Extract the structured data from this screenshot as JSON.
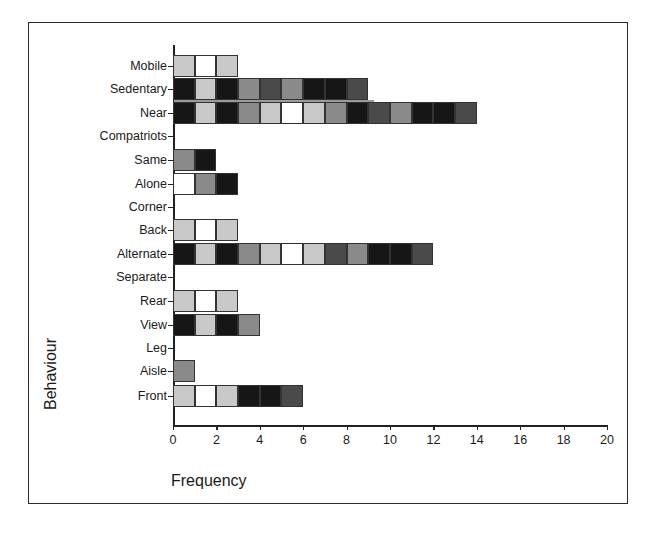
{
  "chart_data": {
    "type": "bar",
    "orientation": "horizontal",
    "stacked": true,
    "title": "",
    "xlabel": "Frequency",
    "ylabel": "Behaviour",
    "xlim": [
      0,
      20
    ],
    "xticks": [
      0,
      2,
      4,
      6,
      8,
      10,
      12,
      14,
      16,
      18,
      20
    ],
    "grid": false,
    "legend": null,
    "categories": [
      "Mobile",
      "Sedentary",
      "Near",
      "Compatriots",
      "Same",
      "Alone",
      "Corner",
      "Back",
      "Alternate",
      "Separate",
      "Rear",
      "View",
      "Leg",
      "Aisle",
      "Front"
    ],
    "values": [
      3,
      9,
      14,
      0,
      2,
      3,
      0,
      3,
      12,
      0,
      3,
      4,
      0,
      1,
      6
    ],
    "segment_shades": {
      "Mobile": [
        "light",
        "white",
        "light"
      ],
      "Sedentary": [
        "dark",
        "light",
        "dark",
        "mid",
        "darkmid",
        "mid",
        "dark",
        "dark",
        "darkmid"
      ],
      "Near": [
        "dark",
        "light",
        "dark",
        "mid",
        "light",
        "white",
        "light",
        "mid",
        "dark",
        "darkmid",
        "mid",
        "dark",
        "dark",
        "darkmid"
      ],
      "Compatriots": [],
      "Same": [
        "mid",
        "dark"
      ],
      "Alone": [
        "white",
        "mid",
        "dark"
      ],
      "Corner": [],
      "Back": [
        "light",
        "white",
        "light"
      ],
      "Alternate": [
        "dark",
        "light",
        "dark",
        "mid",
        "light",
        "white",
        "light",
        "darkmid",
        "mid",
        "dark",
        "dark",
        "darkmid"
      ],
      "Separate": [],
      "Rear": [
        "light",
        "white",
        "light"
      ],
      "View": [
        "dark",
        "light",
        "dark",
        "mid"
      ],
      "Leg": [],
      "Aisle": [
        "mid"
      ],
      "Front": [
        "light",
        "white",
        "light",
        "dark",
        "dark",
        "darkmid"
      ]
    },
    "shade_colors": {
      "white": "#ffffff",
      "light": "#c8c8c8",
      "mid": "#8a8a8a",
      "darkmid": "#4a4a4a",
      "dark": "#161616"
    }
  }
}
